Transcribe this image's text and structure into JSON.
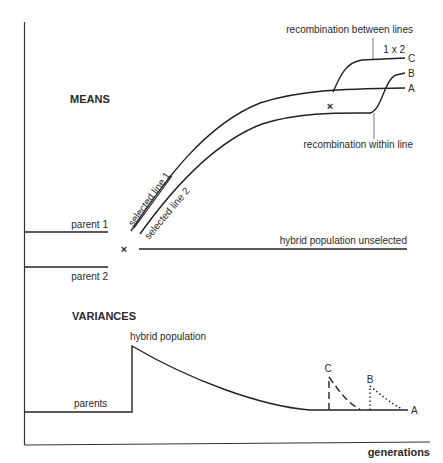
{
  "figure": {
    "means_section": {
      "title": "MEANS",
      "labels": {
        "parent_1": "parent 1",
        "parent_2": "parent 2",
        "cross_symbol": "×",
        "selected_line_1": "selected line 1",
        "selected_line_2": "selected line 2",
        "hybrid_unselected": "hybrid population unselected",
        "recombination_between": "recombination between lines",
        "recombination_within": "recombination within line",
        "cross_1x2": "1 x 2",
        "end_C": "C",
        "end_B": "B",
        "end_A": "A"
      }
    },
    "variances_section": {
      "title": "VARIANCES",
      "labels": {
        "hybrid_population": "hybrid population",
        "parents": "parents",
        "peak_C": "C",
        "peak_B": "B",
        "end_A": "A"
      }
    },
    "axes": {
      "x_label": "generations"
    },
    "colors": {
      "line": "#222222",
      "text": "#2a2a2a",
      "background": "#ffffff"
    }
  }
}
